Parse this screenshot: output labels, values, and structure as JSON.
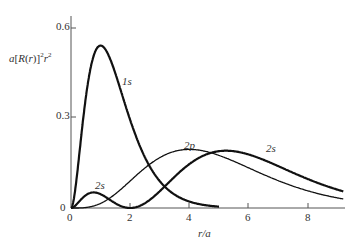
{
  "chart_data": {
    "type": "line",
    "title": "",
    "xlabel": "r/a",
    "ylabel": "a[R(r)]^2 r^2",
    "xlim": [
      0,
      9.2
    ],
    "ylim": [
      0,
      0.62
    ],
    "x_ticks": [
      "0",
      "2",
      "4",
      "6",
      "8"
    ],
    "y_ticks": [
      "0",
      "0.3",
      "0.6"
    ],
    "grid": false,
    "legend": "inline labels",
    "series": [
      {
        "name": "1s",
        "formula": "4 x^2 e^{-2x}",
        "peak": {
          "x": 1.0,
          "y": 0.54
        }
      },
      {
        "name": "2s",
        "formula": "(x^2/8)(2-x)^2 e^{-x}",
        "peak_small": {
          "x": 0.76,
          "y": 0.05
        },
        "node": 2.0,
        "peak": {
          "x": 5.24,
          "y": 0.19
        }
      },
      {
        "name": "2p",
        "formula": "(x^4/24) e^{-x}",
        "peak": {
          "x": 4.0,
          "y": 0.195
        }
      }
    ],
    "annotations": [
      "1s",
      "2s",
      "2p",
      "2s"
    ]
  },
  "labels": {
    "ylabel_a": "a[R(",
    "ylabel_r": "r",
    "ylabel_tail": ")]",
    "xlabel": "r/a",
    "y0": "0",
    "y03": "0.3",
    "y06": "0.6",
    "x0": "0",
    "x2": "2",
    "x4": "4",
    "x6": "6",
    "x8": "8",
    "l1s": "1s",
    "l2s_small": "2s",
    "l2p": "2p",
    "l2s": "2s"
  }
}
